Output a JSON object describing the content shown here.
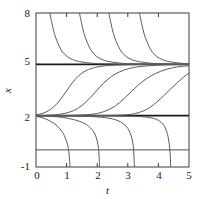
{
  "chart_data": {
    "type": "line",
    "title": "",
    "subtitle": "",
    "xlabel": "t",
    "ylabel": "x",
    "xlim": [
      0,
      5
    ],
    "ylim": [
      -1,
      8
    ],
    "grid": false,
    "legend": null,
    "legend_position": "none",
    "xticks": [
      0,
      1,
      2,
      3,
      4,
      5
    ],
    "xtick_labels": [
      "0",
      "1",
      "2",
      "3",
      "4",
      "5"
    ],
    "yticks": [
      -1,
      2,
      5,
      8
    ],
    "ytick_labels": [
      "-1",
      "2",
      "5",
      "8"
    ],
    "annotations": [
      "Solution curves of an autonomous ODE with equilibria at x = 5 (stable) and x = 2 (unstable)"
    ],
    "equilibria": [
      {
        "name": "stable-equilibrium",
        "value": 5,
        "style": "thick"
      },
      {
        "name": "unstable-equilibrium",
        "value": 2,
        "style": "thick"
      },
      {
        "name": "reference-line-zero",
        "value": 0,
        "style": "thin"
      }
    ],
    "series": [
      {
        "name": "above-stable-1",
        "region": "above-5",
        "points": [
          [
            0.45,
            8.0
          ],
          [
            0.52,
            7.4
          ],
          [
            0.6,
            6.8
          ],
          [
            0.7,
            6.3
          ],
          [
            0.82,
            5.85
          ],
          [
            0.95,
            5.56
          ],
          [
            1.1,
            5.36
          ],
          [
            1.3,
            5.21
          ],
          [
            1.55,
            5.12
          ],
          [
            1.85,
            5.06
          ],
          [
            2.2,
            5.03
          ],
          [
            2.7,
            5.01
          ],
          [
            3.4,
            5.004
          ],
          [
            4.2,
            5.001
          ],
          [
            5.0,
            5.0
          ]
        ]
      },
      {
        "name": "above-stable-2",
        "region": "above-5",
        "points": [
          [
            1.42,
            8.0
          ],
          [
            1.49,
            7.4
          ],
          [
            1.57,
            6.8
          ],
          [
            1.67,
            6.3
          ],
          [
            1.79,
            5.85
          ],
          [
            1.92,
            5.56
          ],
          [
            2.07,
            5.36
          ],
          [
            2.27,
            5.21
          ],
          [
            2.52,
            5.12
          ],
          [
            2.82,
            5.06
          ],
          [
            3.17,
            5.03
          ],
          [
            3.67,
            5.01
          ],
          [
            4.3,
            5.004
          ],
          [
            5.0,
            5.0
          ]
        ]
      },
      {
        "name": "above-stable-3",
        "region": "above-5",
        "points": [
          [
            2.38,
            8.0
          ],
          [
            2.45,
            7.4
          ],
          [
            2.53,
            6.8
          ],
          [
            2.63,
            6.3
          ],
          [
            2.75,
            5.85
          ],
          [
            2.88,
            5.56
          ],
          [
            3.03,
            5.36
          ],
          [
            3.23,
            5.21
          ],
          [
            3.48,
            5.12
          ],
          [
            3.78,
            5.06
          ],
          [
            4.13,
            5.03
          ],
          [
            4.55,
            5.01
          ],
          [
            5.0,
            5.0
          ]
        ]
      },
      {
        "name": "above-stable-4",
        "region": "above-5",
        "points": [
          [
            3.38,
            8.0
          ],
          [
            3.45,
            7.4
          ],
          [
            3.53,
            6.8
          ],
          [
            3.63,
            6.3
          ],
          [
            3.75,
            5.85
          ],
          [
            3.88,
            5.56
          ],
          [
            4.03,
            5.36
          ],
          [
            4.23,
            5.21
          ],
          [
            4.48,
            5.12
          ],
          [
            4.76,
            5.06
          ],
          [
            5.0,
            5.02
          ]
        ]
      },
      {
        "name": "between-equilibria-1",
        "region": "between-2-and-5",
        "points": [
          [
            0.0,
            2.05
          ],
          [
            0.2,
            2.13
          ],
          [
            0.4,
            2.28
          ],
          [
            0.6,
            2.55
          ],
          [
            0.8,
            2.95
          ],
          [
            1.0,
            3.45
          ],
          [
            1.2,
            3.95
          ],
          [
            1.4,
            4.34
          ],
          [
            1.6,
            4.6
          ],
          [
            1.85,
            4.78
          ],
          [
            2.15,
            4.89
          ],
          [
            2.55,
            4.95
          ],
          [
            3.1,
            4.98
          ],
          [
            3.9,
            4.995
          ],
          [
            5.0,
            5.0
          ]
        ]
      },
      {
        "name": "between-equilibria-2",
        "region": "between-2-and-5",
        "points": [
          [
            0.0,
            2.005
          ],
          [
            0.45,
            2.03
          ],
          [
            0.8,
            2.09
          ],
          [
            1.1,
            2.21
          ],
          [
            1.35,
            2.41
          ],
          [
            1.6,
            2.75
          ],
          [
            1.85,
            3.2
          ],
          [
            2.1,
            3.7
          ],
          [
            2.35,
            4.13
          ],
          [
            2.6,
            4.44
          ],
          [
            2.9,
            4.68
          ],
          [
            3.25,
            4.83
          ],
          [
            3.7,
            4.92
          ],
          [
            4.25,
            4.97
          ],
          [
            5.0,
            4.99
          ]
        ]
      },
      {
        "name": "between-equilibria-3",
        "region": "between-2-and-5",
        "points": [
          [
            0.0,
            2.0008
          ],
          [
            0.7,
            2.005
          ],
          [
            1.25,
            2.02
          ],
          [
            1.7,
            2.06
          ],
          [
            2.05,
            2.15
          ],
          [
            2.35,
            2.33
          ],
          [
            2.6,
            2.58
          ],
          [
            2.85,
            2.95
          ],
          [
            3.1,
            3.38
          ],
          [
            3.35,
            3.8
          ],
          [
            3.6,
            4.15
          ],
          [
            3.9,
            4.46
          ],
          [
            4.25,
            4.7
          ],
          [
            4.6,
            4.84
          ],
          [
            5.0,
            4.92
          ]
        ]
      },
      {
        "name": "between-equilibria-4",
        "region": "between-2-and-5",
        "points": [
          [
            0.0,
            2.0001
          ],
          [
            1.2,
            2.0008
          ],
          [
            2.0,
            2.004
          ],
          [
            2.55,
            2.015
          ],
          [
            2.95,
            2.05
          ],
          [
            3.25,
            2.13
          ],
          [
            3.5,
            2.27
          ],
          [
            3.72,
            2.48
          ],
          [
            3.95,
            2.8
          ],
          [
            4.18,
            3.18
          ],
          [
            4.4,
            3.56
          ],
          [
            4.62,
            3.93
          ],
          [
            4.82,
            4.25
          ],
          [
            5.0,
            4.5
          ]
        ]
      },
      {
        "name": "below-unstable-1",
        "region": "below-2",
        "points": [
          [
            0.0,
            1.96
          ],
          [
            0.2,
            1.88
          ],
          [
            0.4,
            1.74
          ],
          [
            0.58,
            1.56
          ],
          [
            0.72,
            1.35
          ],
          [
            0.84,
            1.1
          ],
          [
            0.93,
            0.82
          ],
          [
            1.0,
            0.5
          ],
          [
            1.05,
            0.15
          ],
          [
            1.08,
            -0.25
          ],
          [
            1.1,
            -0.65
          ],
          [
            1.11,
            -1.0
          ]
        ]
      },
      {
        "name": "below-unstable-2",
        "region": "below-2",
        "points": [
          [
            0.0,
            1.995
          ],
          [
            0.5,
            1.96
          ],
          [
            0.9,
            1.89
          ],
          [
            1.25,
            1.76
          ],
          [
            1.55,
            1.58
          ],
          [
            1.72,
            1.38
          ],
          [
            1.85,
            1.14
          ],
          [
            1.94,
            0.86
          ],
          [
            2.0,
            0.52
          ],
          [
            2.04,
            0.14
          ],
          [
            2.06,
            -0.3
          ],
          [
            2.07,
            -0.7
          ],
          [
            2.08,
            -1.0
          ]
        ]
      },
      {
        "name": "below-unstable-3",
        "region": "below-2",
        "points": [
          [
            0.0,
            1.9992
          ],
          [
            0.8,
            1.992
          ],
          [
            1.5,
            1.97
          ],
          [
            2.05,
            1.92
          ],
          [
            2.45,
            1.83
          ],
          [
            2.7,
            1.69
          ],
          [
            2.88,
            1.5
          ],
          [
            3.0,
            1.26
          ],
          [
            3.08,
            0.97
          ],
          [
            3.14,
            0.62
          ],
          [
            3.18,
            0.2
          ],
          [
            3.2,
            -0.3
          ],
          [
            3.21,
            -0.7
          ],
          [
            3.22,
            -1.0
          ]
        ]
      },
      {
        "name": "below-unstable-4",
        "region": "below-2",
        "points": [
          [
            0.0,
            1.99985
          ],
          [
            1.1,
            1.9988
          ],
          [
            2.0,
            1.995
          ],
          [
            2.7,
            1.984
          ],
          [
            3.25,
            1.96
          ],
          [
            3.62,
            1.91
          ],
          [
            3.88,
            1.82
          ],
          [
            4.04,
            1.68
          ],
          [
            4.16,
            1.48
          ],
          [
            4.24,
            1.22
          ],
          [
            4.3,
            0.9
          ],
          [
            4.34,
            0.52
          ],
          [
            4.37,
            0.1
          ],
          [
            4.39,
            -0.4
          ],
          [
            4.4,
            -1.0
          ]
        ]
      }
    ]
  },
  "axes": {
    "x_title": "t",
    "y_title": "x"
  },
  "style": {
    "curve_color": "#5a5a5a",
    "equilibrium_color": "#1a1a1a",
    "frame_color": "#3a3a3a",
    "text_color": "#1a1a1a",
    "background": "#ffffff"
  }
}
